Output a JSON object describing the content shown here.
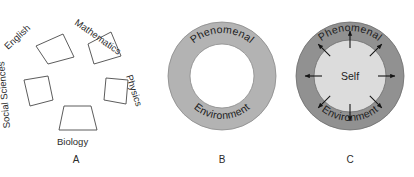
{
  "figure": {
    "background_color": "#ffffff",
    "panels": [
      {
        "id": "A",
        "caption": "A",
        "type": "radial-subject-segments",
        "subjects": [
          {
            "label": "English",
            "angle_deg": -45,
            "cx": 49,
            "cy": 47
          },
          {
            "label": "Mathematics",
            "angle_deg": 36,
            "cx": 101,
            "cy": 46
          },
          {
            "label": "Physics",
            "angle_deg": 72,
            "cx": 117,
            "cy": 96
          },
          {
            "label": "Biology",
            "angle_deg": 0,
            "cx": 76,
            "cy": 119
          },
          {
            "label": "Social Sciences",
            "angle_deg": -95,
            "cx": 36,
            "cy": 96
          }
        ]
      },
      {
        "id": "B",
        "caption": "B",
        "type": "annulus",
        "outer_label": "Phenomenal",
        "inner_label": "Environment",
        "ring_color": "#b3b3b3",
        "hole_color": "#ffffff",
        "stroke_color": "#8a8a8a",
        "center": {
          "x": 222,
          "y": 76
        },
        "outer_radius": 54,
        "inner_radius": 32
      },
      {
        "id": "C",
        "caption": "C",
        "type": "annulus-with-self",
        "outer_label": "Phenomenal",
        "inner_label": "Environment",
        "center_label": "Self",
        "ring_color": "#919191",
        "hole_color": "#dcdcdc",
        "stroke_color": "#6e6e6e",
        "arrow_color": "#141414",
        "arrow_count": 8,
        "arrow_direction": "outward",
        "center": {
          "x": 350,
          "y": 76
        },
        "outer_radius": 54,
        "inner_radius": 36
      }
    ]
  }
}
